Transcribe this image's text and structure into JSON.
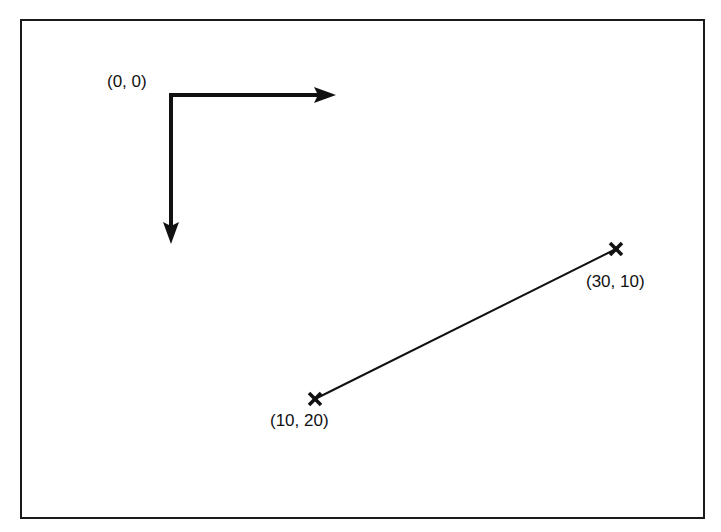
{
  "diagram": {
    "origin_label": "(0, 0)",
    "axes": {
      "x_arrow": {
        "from": [
          171,
          95
        ],
        "to": [
          335,
          95
        ]
      },
      "y_arrow": {
        "from": [
          171,
          95
        ],
        "to": [
          171,
          243
        ]
      }
    },
    "line": {
      "start": {
        "label": "(10, 20)",
        "pos": [
          315,
          399
        ]
      },
      "end": {
        "label": "(30, 10)",
        "pos": [
          616,
          249
        ]
      }
    }
  }
}
